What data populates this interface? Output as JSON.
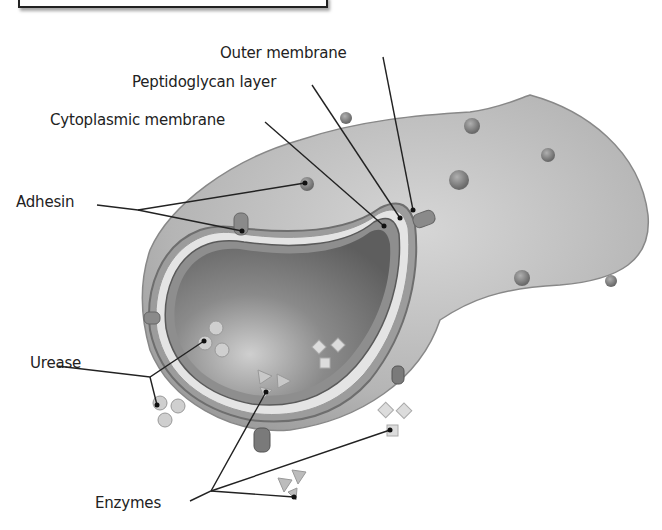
{
  "diagram": {
    "labels": {
      "outer_membrane": "Outer membrane",
      "peptidoglycan_layer": "Peptidoglycan layer",
      "cytoplasmic_membrane": "Cytoplasmic membrane",
      "adhesin": "Adhesin",
      "urease": "Urease",
      "enzymes": "Enzymes"
    },
    "colors": {
      "cell_surface": "#b9b9b9",
      "cytoplasm": "#6e6e6e",
      "membrane_light": "#e6e6e6",
      "protein": "#8a8a8a",
      "marker_fill": "#cfcfcf",
      "leader_line": "#222222"
    }
  }
}
